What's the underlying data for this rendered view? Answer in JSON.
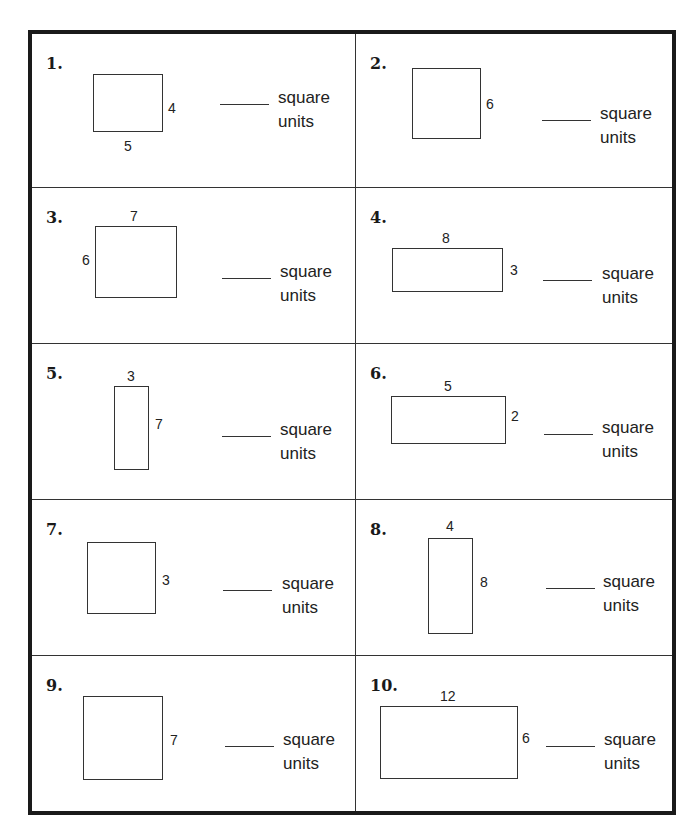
{
  "worksheet": {
    "unit_label_line1": "square",
    "unit_label_line2": "units",
    "problems": [
      {
        "number": "1.",
        "width": "5",
        "height": "4",
        "labels": [
          "width-bottom",
          "height-right"
        ]
      },
      {
        "number": "2.",
        "side": "6",
        "labels": [
          "side-right"
        ]
      },
      {
        "number": "3.",
        "width": "7",
        "height": "6",
        "labels": [
          "width-top",
          "height-left"
        ]
      },
      {
        "number": "4.",
        "width": "8",
        "height": "3",
        "labels": [
          "width-top",
          "height-right"
        ]
      },
      {
        "number": "5.",
        "width": "3",
        "height": "7",
        "labels": [
          "width-top",
          "height-right"
        ]
      },
      {
        "number": "6.",
        "width": "5",
        "height": "2",
        "labels": [
          "width-top",
          "height-right"
        ]
      },
      {
        "number": "7.",
        "side": "3",
        "labels": [
          "side-right"
        ]
      },
      {
        "number": "8.",
        "width": "4",
        "height": "8",
        "labels": [
          "width-top",
          "height-right"
        ]
      },
      {
        "number": "9.",
        "side": "7",
        "labels": [
          "side-right"
        ]
      },
      {
        "number": "10.",
        "width": "12",
        "height": "6",
        "labels": [
          "width-top",
          "height-right"
        ]
      }
    ]
  }
}
